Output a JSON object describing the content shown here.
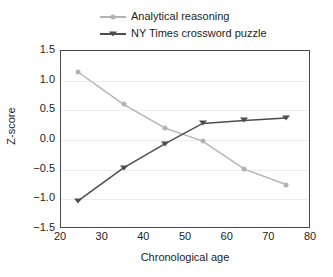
{
  "chart_data": {
    "type": "line",
    "title": "",
    "xlabel": "Chronological age",
    "ylabel": "Z-score",
    "xlim": [
      20,
      80
    ],
    "ylim": [
      -1.5,
      1.5
    ],
    "xticks": [
      20,
      30,
      40,
      50,
      60,
      70,
      80
    ],
    "yticks": [
      -1.5,
      -1.0,
      -0.5,
      0.0,
      0.5,
      1.0,
      1.5
    ],
    "xtick_labels": [
      "20",
      "30",
      "40",
      "50",
      "60",
      "70",
      "80"
    ],
    "ytick_labels": [
      "1.5",
      "1.0",
      "0.5",
      "0.0",
      "-0.5",
      "-1.0",
      "-1.5"
    ],
    "grid": "horizontal",
    "legend_position": "top",
    "x": [
      24,
      35,
      45,
      54,
      64,
      74
    ],
    "series": [
      {
        "name": "Analytical reasoning",
        "color": "#b3b3b3",
        "marker": "circle",
        "values": [
          1.15,
          0.6,
          0.2,
          -0.02,
          -0.49,
          -0.75
        ]
      },
      {
        "name": "NY Times crossword puzzle",
        "color": "#4d4d4d",
        "marker": "triangle-down",
        "values": [
          -1.03,
          -0.47,
          -0.06,
          0.28,
          0.33,
          0.37
        ]
      }
    ]
  },
  "legend": {
    "items": [
      {
        "label": "Analytical reasoning"
      },
      {
        "label": "NY Times crossword puzzle"
      }
    ]
  },
  "axes": {
    "y_title": "Z-score",
    "x_title": "Chronological age"
  },
  "colors": {
    "series_1": "#b3b3b3",
    "series_2": "#4d4d4d",
    "gridline": "#ededed",
    "frame": "#4a4a4a",
    "text": "#1c1c1c",
    "background": "#ffffff"
  }
}
